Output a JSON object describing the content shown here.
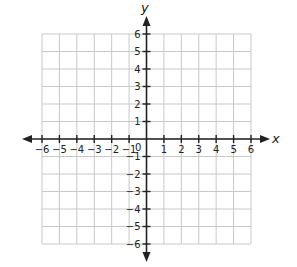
{
  "chart_data": {
    "type": "scatter",
    "title": "",
    "xlabel": "x",
    "ylabel": "y",
    "xlim": [
      -6,
      6
    ],
    "ylim": [
      -6,
      6
    ],
    "grid": true,
    "origin_label": "0",
    "x_ticks": [
      -6,
      -5,
      -4,
      -3,
      -2,
      -1,
      1,
      2,
      3,
      4,
      5,
      6
    ],
    "y_ticks": [
      -6,
      -5,
      -4,
      -3,
      -2,
      -1,
      1,
      2,
      3,
      4,
      5,
      6
    ],
    "x_tick_labels": [
      "−6",
      "−5",
      "−4",
      "−3",
      "−2",
      "−1",
      "1",
      "2",
      "3",
      "4",
      "5",
      "6"
    ],
    "y_tick_labels": [
      "−6",
      "−5",
      "−4",
      "−3",
      "−2",
      "−1",
      "1",
      "2",
      "3",
      "4",
      "5",
      "6"
    ],
    "series": [],
    "axes_arrows": "both directions on both axes",
    "colors": {
      "grid": "#c8c8c8",
      "axis": "#222222",
      "background": "#ffffff"
    }
  },
  "labels": {
    "x_axis": "x",
    "y_axis": "y",
    "origin": "0"
  }
}
